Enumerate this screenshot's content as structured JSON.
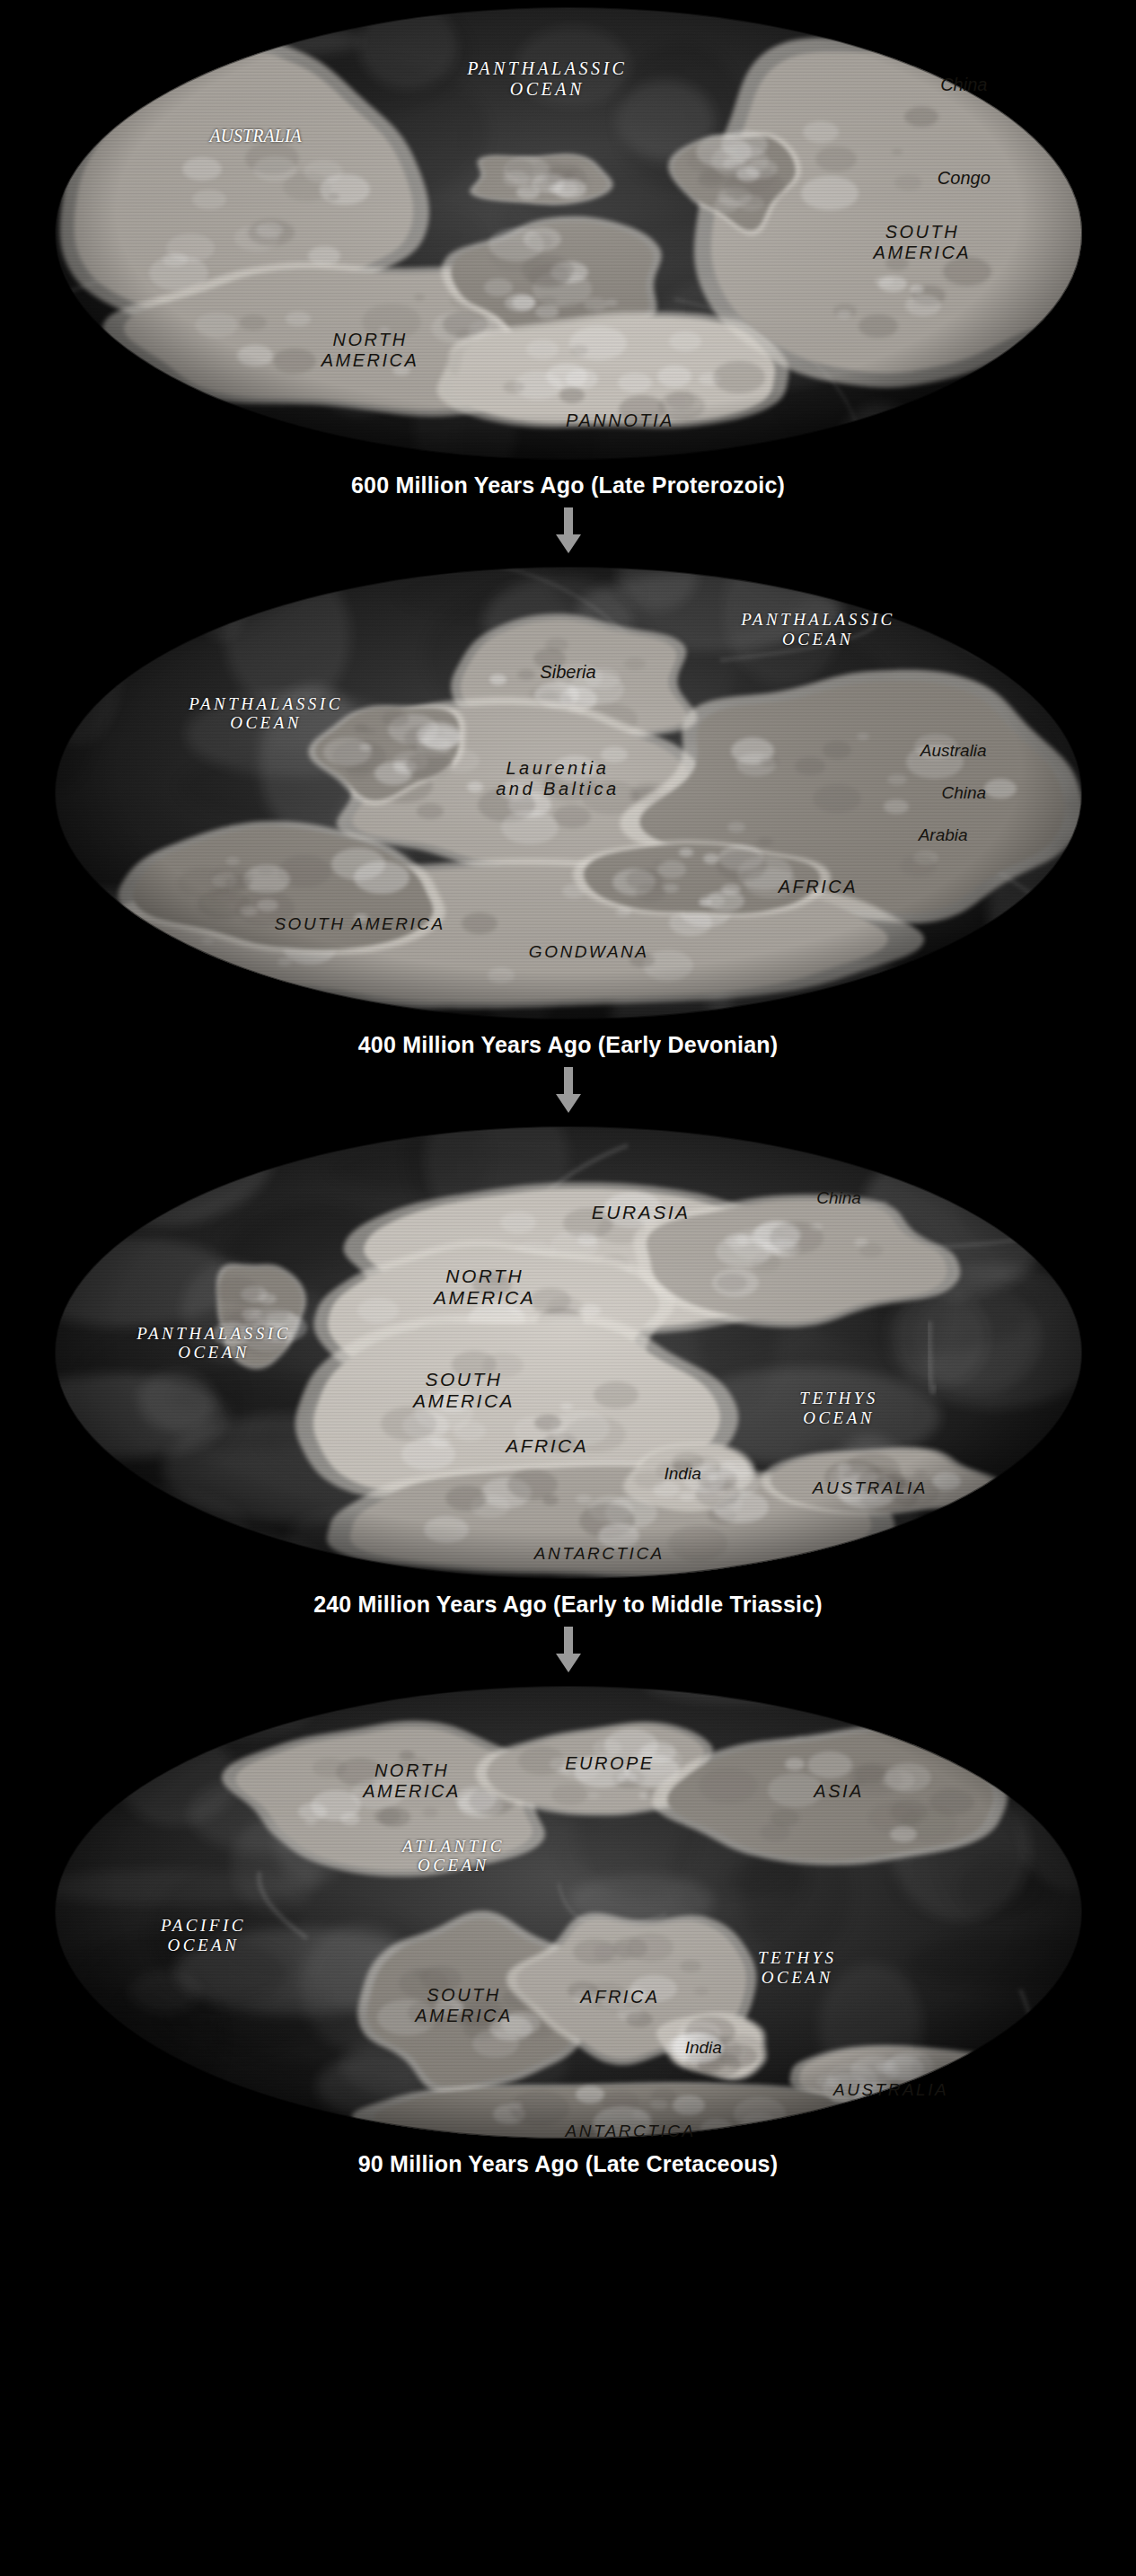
{
  "page": {
    "background_color": "#000000",
    "arrow_color": "#9a9a9a",
    "caption_color": "#ffffff",
    "label_dark_color": "#15130f",
    "label_light_color": "#ffffff"
  },
  "arrow_icon": "down-arrow-icon",
  "panels": [
    {
      "id": "panel-600ma",
      "caption": "600 Million Years Ago (Late Proterozoic)",
      "labels": [
        {
          "name": "panthalassic-ocean",
          "text": "PANTHALASSIC\nOCEAN",
          "tone": "light",
          "x": 48,
          "y": 17,
          "size": 20,
          "style": "spaced"
        },
        {
          "name": "australia",
          "text": "AUSTRALIA",
          "tone": "light",
          "x": 20,
          "y": 29,
          "size": 20,
          "style": "plain"
        },
        {
          "name": "china",
          "text": "China",
          "tone": "dark",
          "x": 88,
          "y": 18,
          "size": 20,
          "style": "plain"
        },
        {
          "name": "congo",
          "text": "Congo",
          "tone": "dark",
          "x": 88,
          "y": 38,
          "size": 20,
          "style": "plain"
        },
        {
          "name": "south-america",
          "text": "SOUTH\nAMERICA",
          "tone": "dark",
          "x": 84,
          "y": 52,
          "size": 20,
          "style": "caps"
        },
        {
          "name": "north-america",
          "text": "NORTH\nAMERICA",
          "tone": "dark",
          "x": 31,
          "y": 75,
          "size": 20,
          "style": "caps"
        },
        {
          "name": "pannotia",
          "text": "PANNOTIA",
          "tone": "dark",
          "x": 55,
          "y": 90,
          "size": 20,
          "style": "caps"
        }
      ]
    },
    {
      "id": "panel-400ma",
      "caption": "400 Million Years Ago (Early Devonian)",
      "labels": [
        {
          "name": "panthalassic-ocean-right",
          "text": "PANTHALASSIC\nOCEAN",
          "tone": "light",
          "x": 74,
          "y": 15,
          "size": 19,
          "style": "spaced"
        },
        {
          "name": "panthalassic-ocean-left",
          "text": "PANTHALASSIC\nOCEAN",
          "tone": "light",
          "x": 21,
          "y": 33,
          "size": 19,
          "style": "spaced"
        },
        {
          "name": "siberia",
          "text": "Siberia",
          "tone": "dark",
          "x": 50,
          "y": 24,
          "size": 20,
          "style": "plain"
        },
        {
          "name": "laurentia-and-baltica",
          "text": "Laurentia\nand Baltica",
          "tone": "dark",
          "x": 49,
          "y": 47,
          "size": 20,
          "style": "spaced"
        },
        {
          "name": "australia",
          "text": "Australia",
          "tone": "dark",
          "x": 87,
          "y": 41,
          "size": 19,
          "style": "plain"
        },
        {
          "name": "china",
          "text": "China",
          "tone": "dark",
          "x": 88,
          "y": 50,
          "size": 19,
          "style": "plain"
        },
        {
          "name": "arabia",
          "text": "Arabia",
          "tone": "dark",
          "x": 86,
          "y": 59,
          "size": 19,
          "style": "plain"
        },
        {
          "name": "africa",
          "text": "AFRICA",
          "tone": "dark",
          "x": 74,
          "y": 70,
          "size": 20,
          "style": "caps"
        },
        {
          "name": "south-america",
          "text": "SOUTH AMERICA",
          "tone": "dark",
          "x": 30,
          "y": 78,
          "size": 19,
          "style": "caps"
        },
        {
          "name": "gondwana",
          "text": "GONDWANA",
          "tone": "dark",
          "x": 52,
          "y": 84,
          "size": 19,
          "style": "caps"
        }
      ]
    },
    {
      "id": "panel-240ma",
      "caption": "240 Million Years Ago (Early to Middle Triassic)",
      "labels": [
        {
          "name": "eurasia",
          "text": "EURASIA",
          "tone": "dark",
          "x": 57,
          "y": 20,
          "size": 21,
          "style": "caps"
        },
        {
          "name": "china",
          "text": "China",
          "tone": "dark",
          "x": 76,
          "y": 17,
          "size": 19,
          "style": "plain"
        },
        {
          "name": "north-america",
          "text": "NORTH\nAMERICA",
          "tone": "dark",
          "x": 42,
          "y": 36,
          "size": 21,
          "style": "caps"
        },
        {
          "name": "panthalassic-ocean",
          "text": "PANTHALASSIC\nOCEAN",
          "tone": "light",
          "x": 16,
          "y": 48,
          "size": 19,
          "style": "spaced"
        },
        {
          "name": "south-america",
          "text": "SOUTH\nAMERICA",
          "tone": "dark",
          "x": 40,
          "y": 58,
          "size": 21,
          "style": "caps"
        },
        {
          "name": "africa",
          "text": "AFRICA",
          "tone": "dark",
          "x": 48,
          "y": 70,
          "size": 21,
          "style": "caps"
        },
        {
          "name": "india",
          "text": "India",
          "tone": "dark",
          "x": 61,
          "y": 76,
          "size": 19,
          "style": "plain"
        },
        {
          "name": "tethys-ocean",
          "text": "TETHYS\nOCEAN",
          "tone": "light",
          "x": 76,
          "y": 62,
          "size": 19,
          "style": "spaced"
        },
        {
          "name": "australia",
          "text": "AUSTRALIA",
          "tone": "dark",
          "x": 79,
          "y": 79,
          "size": 19,
          "style": "caps"
        },
        {
          "name": "antarctica",
          "text": "ANTARCTICA",
          "tone": "dark",
          "x": 53,
          "y": 93,
          "size": 19,
          "style": "caps"
        }
      ]
    },
    {
      "id": "panel-90ma",
      "caption": "90 Million Years Ago (Late Cretaceous)",
      "labels": [
        {
          "name": "north-america",
          "text": "NORTH\nAMERICA",
          "tone": "dark",
          "x": 35,
          "y": 22,
          "size": 20,
          "style": "caps"
        },
        {
          "name": "europe",
          "text": "EUROPE",
          "tone": "dark",
          "x": 54,
          "y": 18,
          "size": 20,
          "style": "caps"
        },
        {
          "name": "asia",
          "text": "ASIA",
          "tone": "dark",
          "x": 76,
          "y": 24,
          "size": 20,
          "style": "caps"
        },
        {
          "name": "atlantic-ocean",
          "text": "ATLANTIC\nOCEAN",
          "tone": "light",
          "x": 39,
          "y": 38,
          "size": 19,
          "style": "spaced"
        },
        {
          "name": "pacific-ocean",
          "text": "PACIFIC\nOCEAN",
          "tone": "light",
          "x": 15,
          "y": 55,
          "size": 19,
          "style": "spaced"
        },
        {
          "name": "south-america",
          "text": "SOUTH\nAMERICA",
          "tone": "dark",
          "x": 40,
          "y": 70,
          "size": 20,
          "style": "caps"
        },
        {
          "name": "africa",
          "text": "AFRICA",
          "tone": "dark",
          "x": 55,
          "y": 68,
          "size": 20,
          "style": "caps"
        },
        {
          "name": "tethys-ocean",
          "text": "TETHYS\nOCEAN",
          "tone": "light",
          "x": 72,
          "y": 62,
          "size": 19,
          "style": "spaced"
        },
        {
          "name": "india",
          "text": "India",
          "tone": "dark",
          "x": 63,
          "y": 79,
          "size": 19,
          "style": "plain"
        },
        {
          "name": "australia",
          "text": "AUSTRALIA",
          "tone": "dark",
          "x": 81,
          "y": 88,
          "size": 19,
          "style": "caps"
        },
        {
          "name": "antarctica",
          "text": "ANTARCTICA",
          "tone": "dark",
          "x": 56,
          "y": 97,
          "size": 19,
          "style": "caps"
        }
      ]
    }
  ]
}
